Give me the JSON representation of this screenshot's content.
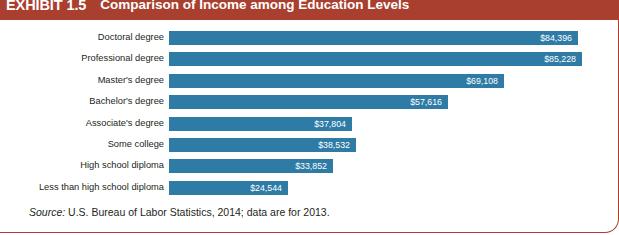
{
  "header": {
    "exhibit_tag": "EXHIBIT 1.5",
    "title": "Comparison of Income among Education Levels",
    "band_color": "#a9402f"
  },
  "source_note": {
    "label": "Source:",
    "text": " U.S. Bureau of Labor Statistics, 2014; data are for 2013."
  },
  "chart_data": {
    "type": "bar",
    "orientation": "horizontal",
    "title": "Comparison of Income among Education Levels",
    "xlabel": "",
    "ylabel": "",
    "grid": false,
    "legend": "none",
    "bar_color": "#2e7ba6",
    "value_prefix": "$",
    "xlim": [
      0,
      85228
    ],
    "categories": [
      "Doctoral degree",
      "Professional degree",
      "Master's degree",
      "Bachelor's degree",
      "Associate's degree",
      "Some college",
      "High school diploma",
      "Less than high school diploma"
    ],
    "values": [
      84396,
      85228,
      69108,
      57616,
      37804,
      38532,
      33852,
      24544
    ],
    "value_labels": [
      "$84,396",
      "$85,228",
      "$69,108",
      "$57,616",
      "$37,804",
      "$38,532",
      "$33,852",
      "$24,544"
    ]
  }
}
